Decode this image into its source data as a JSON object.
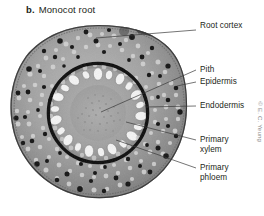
{
  "figure": {
    "panel_letter": "b.",
    "title": "Monocot root",
    "credit": "© E. C. Yeung",
    "image_type": "light micrograph cross-section",
    "colors": {
      "text": "#231f20",
      "leader_line": "#3a3a3a",
      "background": "#ffffff",
      "endodermis_dark": "#101010",
      "cortex_gray": "#9a9a9a",
      "stele_gray": "#a6a6a6",
      "xylem_white": "#f2f2f2"
    }
  },
  "labels": [
    {
      "id": "root-cortex",
      "text": "Root cortex",
      "x": 198,
      "y": 26,
      "leader": {
        "x1": 196,
        "y1": 30,
        "x2": 96,
        "y2": 38
      }
    },
    {
      "id": "pith",
      "text": "Pith",
      "x": 198,
      "y": 66,
      "leader": {
        "x1": 196,
        "y1": 70,
        "x2": 101,
        "y2": 112
      }
    },
    {
      "id": "epidermis",
      "text": "Epidermis",
      "x": 198,
      "y": 78,
      "leader": {
        "x1": 196,
        "y1": 82,
        "x2": 178,
        "y2": 86
      }
    },
    {
      "id": "endodermis",
      "text": "Endodermis",
      "x": 198,
      "y": 102,
      "leader": {
        "x1": 196,
        "y1": 106,
        "x2": 146,
        "y2": 107
      }
    },
    {
      "id": "primary-xylem",
      "text": "Primary",
      "text2": "xylem",
      "x": 198,
      "y": 136,
      "leader": {
        "x1": 196,
        "y1": 140,
        "x2": 125,
        "y2": 122
      }
    },
    {
      "id": "primary-phloem",
      "text": "Primary",
      "text2": "phloem",
      "x": 198,
      "y": 164,
      "leader": {
        "x1": 196,
        "y1": 168,
        "x2": 116,
        "y2": 139
      }
    }
  ],
  "anatomy": {
    "center_x": 98,
    "center_y": 113,
    "root_radius": 88,
    "stele_radius": 49,
    "endodermis_radius": 50,
    "pith_radius": 27,
    "xylem_count": 22,
    "phloem_count": 22
  }
}
